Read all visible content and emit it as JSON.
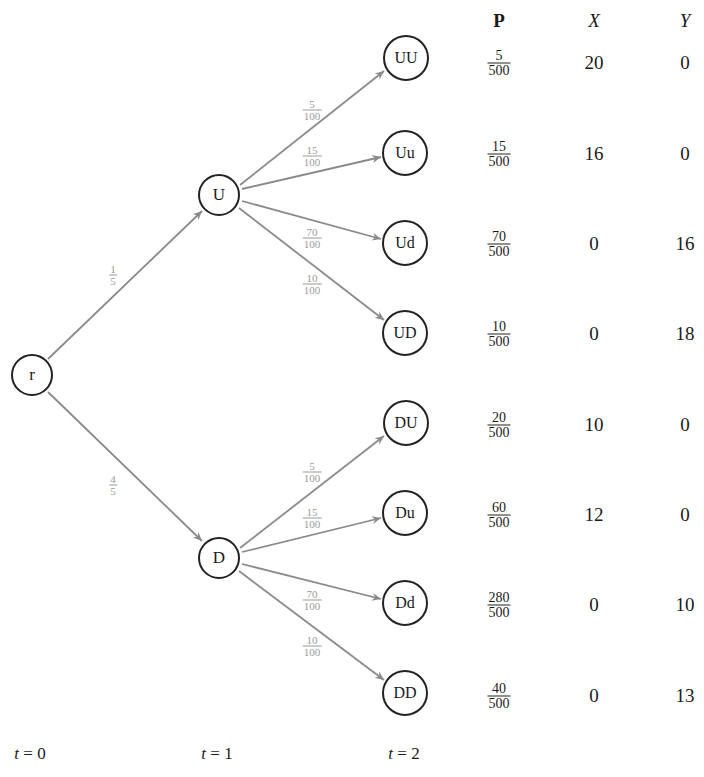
{
  "tree": {
    "root": {
      "label": "r"
    },
    "level1": [
      {
        "label": "U",
        "prob_num": "1",
        "prob_den": "5"
      },
      {
        "label": "D",
        "prob_num": "4",
        "prob_den": "5"
      }
    ],
    "edge_probs": [
      {
        "num": "5",
        "den": "100"
      },
      {
        "num": "15",
        "den": "100"
      },
      {
        "num": "70",
        "den": "100"
      },
      {
        "num": "10",
        "den": "100"
      }
    ],
    "leaves": [
      {
        "label": "UU",
        "p_num": "5",
        "p_den": "500",
        "x": "20",
        "y": "0"
      },
      {
        "label": "Uu",
        "p_num": "15",
        "p_den": "500",
        "x": "16",
        "y": "0"
      },
      {
        "label": "Ud",
        "p_num": "70",
        "p_den": "500",
        "x": "0",
        "y": "16"
      },
      {
        "label": "UD",
        "p_num": "10",
        "p_den": "500",
        "x": "0",
        "y": "18"
      },
      {
        "label": "DU",
        "p_num": "20",
        "p_den": "500",
        "x": "10",
        "y": "0"
      },
      {
        "label": "Du",
        "p_num": "60",
        "p_den": "500",
        "x": "12",
        "y": "0"
      },
      {
        "label": "Dd",
        "p_num": "280",
        "p_den": "500",
        "x": "0",
        "y": "10"
      },
      {
        "label": "DD",
        "p_num": "40",
        "p_den": "500",
        "x": "0",
        "y": "13"
      }
    ]
  },
  "table": {
    "headers": {
      "p": "P",
      "x": "X",
      "y": "Y"
    }
  },
  "time_labels": [
    {
      "var": "t",
      "value": "= 0"
    },
    {
      "var": "t",
      "value": "= 1"
    },
    {
      "var": "t",
      "value": "= 2"
    }
  ],
  "colors": {
    "edge": "#8a8a8a",
    "node_border": "#222222",
    "edge_label": "#9a9a9a"
  }
}
